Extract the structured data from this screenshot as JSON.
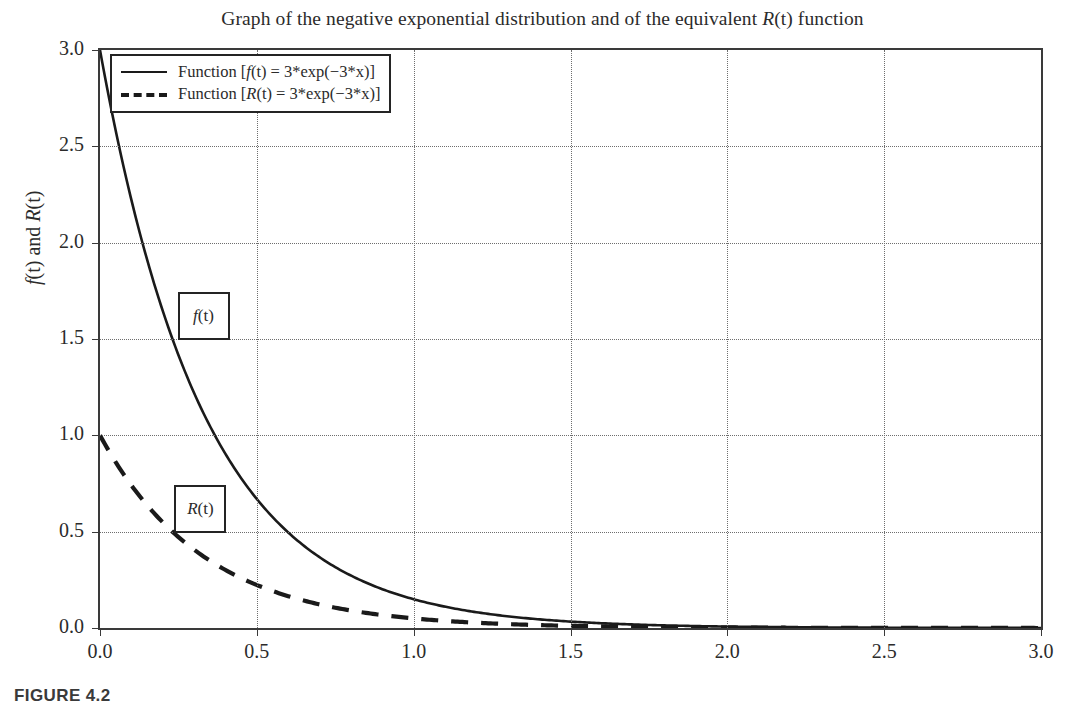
{
  "chart_data": {
    "type": "line",
    "title": "Graph of the negative exponential distribution and of the equivalent R(t) function",
    "title_parts": {
      "before_italic": "Graph of the negative exponential distribution and of the equivalent ",
      "italic": "R",
      "after_italic": "(t) function"
    },
    "xlabel": "",
    "ylabel": "f(t) and R(t)",
    "ylabel_parts": {
      "a_it": "f",
      "a_rest": "(t) and ",
      "b_it": "R",
      "b_rest": "(t)"
    },
    "xlim": [
      0.0,
      3.0
    ],
    "ylim": [
      0.0,
      3.0
    ],
    "xticks": [
      "0.0",
      "0.5",
      "1.0",
      "1.5",
      "2.0",
      "2.5",
      "3.0"
    ],
    "xtick_values": [
      0.0,
      0.5,
      1.0,
      1.5,
      2.0,
      2.5,
      3.0
    ],
    "yticks": [
      "0.0",
      "0.5",
      "1.0",
      "1.5",
      "2.0",
      "2.5",
      "3.0"
    ],
    "ytick_values": [
      0.0,
      0.5,
      1.0,
      1.5,
      2.0,
      2.5,
      3.0
    ],
    "grid": true,
    "grid_style": "dotted",
    "grid_color": "#6e6e6e",
    "legend_position": "upper left",
    "series": [
      {
        "name": "Function [f(t) = 3*exp(-3*x)]",
        "label_parts": {
          "pre": "Function [",
          "it": "f",
          "post": "(t) = 3*exp(−3*x)]"
        },
        "style": "solid",
        "color": "#1a1a1a",
        "formula": "3*exp(-3*x)",
        "amplitude": 3.0,
        "rate": 3.0,
        "x": [
          0.0,
          0.05,
          0.1,
          0.15,
          0.2,
          0.25,
          0.3,
          0.35,
          0.4,
          0.45,
          0.5,
          0.6,
          0.7,
          0.8,
          0.9,
          1.0,
          1.1,
          1.2,
          1.3,
          1.4,
          1.5,
          1.6,
          1.7,
          1.8,
          1.9,
          2.0
        ],
        "y": [
          3.0,
          2.582,
          2.222,
          1.913,
          1.646,
          1.417,
          1.22,
          1.05,
          0.904,
          0.778,
          0.669,
          0.496,
          0.367,
          0.272,
          0.202,
          0.149,
          0.111,
          0.082,
          0.061,
          0.045,
          0.033,
          0.025,
          0.018,
          0.014,
          0.01,
          0.007
        ]
      },
      {
        "name": "Function [R(t) = 3*exp(-3*x)]",
        "label_parts": {
          "pre": "Function [",
          "it": "R",
          "post": "(t) = 3*exp(−3*x)]"
        },
        "style": "dashed",
        "color": "#1a1a1a",
        "formula": "exp(-3*x)",
        "amplitude": 1.0,
        "rate": 3.0,
        "x": [
          0.0,
          0.05,
          0.1,
          0.15,
          0.2,
          0.25,
          0.3,
          0.35,
          0.4,
          0.45,
          0.5,
          0.6,
          0.7,
          0.8,
          0.9,
          1.0,
          1.1,
          1.2,
          1.3,
          1.4,
          1.5,
          1.6,
          1.7,
          1.8,
          1.9,
          2.0
        ],
        "y": [
          1.0,
          0.861,
          0.741,
          0.638,
          0.549,
          0.472,
          0.407,
          0.35,
          0.301,
          0.259,
          0.223,
          0.165,
          0.122,
          0.091,
          0.067,
          0.05,
          0.037,
          0.027,
          0.02,
          0.015,
          0.011,
          0.008,
          0.006,
          0.005,
          0.003,
          0.002
        ]
      }
    ],
    "annotations": [
      {
        "text": "f(t)",
        "it": "f",
        "rest": "(t)",
        "x": 0.33,
        "y": 1.62,
        "boxed": true
      },
      {
        "text": "R(t)",
        "it": "R",
        "rest": "(t)",
        "x": 0.32,
        "y": 0.62,
        "boxed": true
      }
    ]
  },
  "caption": {
    "text": "FIGURE 4.2"
  },
  "colors": {
    "frame": "#3a3a3a",
    "text": "#2b2b2b",
    "curve": "#1a1a1a",
    "grid": "#6e6e6e",
    "background": "#ffffff"
  }
}
